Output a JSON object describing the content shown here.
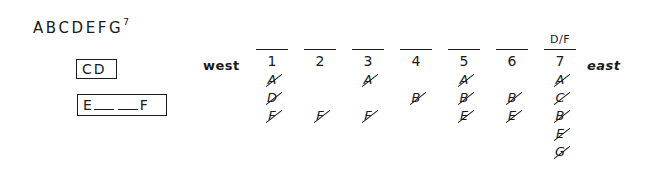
{
  "title": {
    "letters": "ABCDEFG",
    "superscript": "7"
  },
  "boxes": {
    "cd": "CD",
    "ef": {
      "start": "E",
      "end": "F",
      "blanks": 2
    }
  },
  "labels": {
    "west": "west",
    "east": "east"
  },
  "columns": [
    {
      "number": "1",
      "over": "",
      "items": [
        "A",
        "D",
        "F"
      ]
    },
    {
      "number": "2",
      "over": "",
      "items": [
        "",
        "",
        "F"
      ]
    },
    {
      "number": "3",
      "over": "",
      "items": [
        "A",
        "",
        "F"
      ]
    },
    {
      "number": "4",
      "over": "",
      "items": [
        "",
        "B",
        ""
      ]
    },
    {
      "number": "5",
      "over": "",
      "items": [
        "A",
        "B",
        "E"
      ]
    },
    {
      "number": "6",
      "over": "",
      "items": [
        "",
        "B",
        "E"
      ]
    },
    {
      "number": "7",
      "over": "D/F",
      "items": [
        "A",
        "C",
        "B",
        "E",
        "G"
      ]
    }
  ],
  "all_items_struck_out": true
}
